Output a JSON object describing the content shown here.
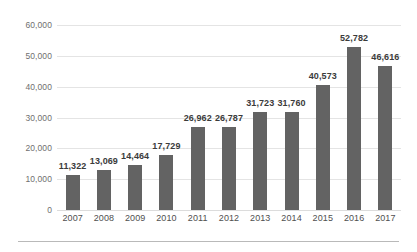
{
  "chart_data": {
    "type": "bar",
    "title": "",
    "subtitle": "",
    "xlabel": "",
    "ylabel": "",
    "categories": [
      "2007",
      "2008",
      "2009",
      "2010",
      "2011",
      "2012",
      "2013",
      "2014",
      "2015",
      "2016",
      "2017"
    ],
    "values": [
      11322,
      13069,
      14464,
      17729,
      26962,
      26787,
      31723,
      31760,
      40573,
      52782,
      46616
    ],
    "value_labels": [
      "11,322",
      "13,069",
      "14,464",
      "17,729",
      "26,962",
      "26,787",
      "31,723",
      "31,760",
      "40,573",
      "52,782",
      "46,616"
    ],
    "ylim": [
      0,
      60000
    ],
    "yticks": [
      0,
      10000,
      20000,
      30000,
      40000,
      50000,
      60000
    ],
    "ytick_labels": [
      "0",
      "10,000",
      "20,000",
      "30,000",
      "40,000",
      "50,000",
      "60,000"
    ],
    "grid": true,
    "grid_axis": "y",
    "legend": false,
    "legend_position": "none",
    "data_labels_shown": true,
    "series": [
      {
        "name": "",
        "values": [
          11322,
          13069,
          14464,
          17729,
          26962,
          26787,
          31723,
          31760,
          40573,
          52782,
          46616
        ]
      }
    ]
  },
  "colors": {
    "bar": "#636363",
    "gridline": "#e4e4e4",
    "baseline": "#dcdcdc",
    "value_label": "#3b3b3b",
    "axis_label": "#6f6f6f",
    "category_label": "#4f4f4f",
    "rule": "#b9b9b9",
    "background": "#ffffff"
  }
}
